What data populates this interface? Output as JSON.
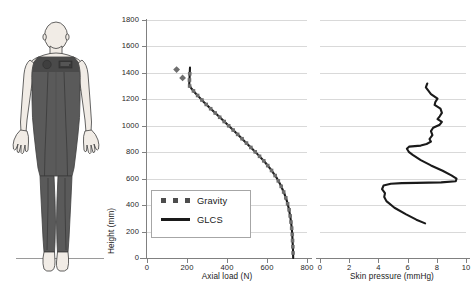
{
  "figure": {
    "name": "human-figure-wearing-glcs",
    "colors": {
      "skin": "#f1ece6",
      "suit": "#5a5a5a",
      "suit_dark": "#4a4a4a",
      "outline": "#3d3d3d",
      "ground": "#9a9a9a"
    }
  },
  "chart_data": [
    {
      "id": "axial-load",
      "type": "line",
      "title": "",
      "xlabel": "Axial load (N)",
      "ylabel": "Height (mm)",
      "xlim": [
        0,
        800
      ],
      "ylim": [
        0,
        1800
      ],
      "xticks": [
        0,
        200,
        400,
        600,
        800
      ],
      "yticks": [
        0,
        200,
        400,
        600,
        800,
        1000,
        1200,
        1400,
        1600,
        1800
      ],
      "grid": "horizontal",
      "legend_position": "bottom-left",
      "series": [
        {
          "name": "Gravity",
          "style": "dotted-marker",
          "color": "#6e6e6e",
          "points": [
            [
              148,
              1425
            ],
            [
              178,
              1362
            ]
          ]
        },
        {
          "name": "GLCS",
          "style": "solid-line",
          "color": "#1a1a1a",
          "points": [
            [
              215,
              1440
            ],
            [
              213,
              1370
            ],
            [
              211,
              1305
            ],
            [
              222,
              1282
            ],
            [
              240,
              1250
            ],
            [
              262,
              1215
            ],
            [
              285,
              1178
            ],
            [
              312,
              1138
            ],
            [
              340,
              1098
            ],
            [
              368,
              1058
            ],
            [
              398,
              1015
            ],
            [
              428,
              972
            ],
            [
              458,
              928
            ],
            [
              490,
              880
            ],
            [
              522,
              832
            ],
            [
              556,
              780
            ],
            [
              588,
              728
            ],
            [
              618,
              672
            ],
            [
              646,
              612
            ],
            [
              668,
              552
            ],
            [
              686,
              490
            ],
            [
              700,
              428
            ],
            [
              710,
              368
            ],
            [
              717,
              308
            ],
            [
              722,
              248
            ],
            [
              726,
              186
            ],
            [
              728,
              124
            ],
            [
              730,
              62
            ],
            [
              731,
              0
            ]
          ]
        }
      ]
    },
    {
      "id": "skin-pressure",
      "type": "line",
      "title": "",
      "xlabel": "Skin pressure (mmHg)",
      "ylabel": "",
      "xlim": [
        0,
        10
      ],
      "ylim": [
        0,
        1800
      ],
      "xticks": [
        0,
        2,
        4,
        6,
        8,
        10
      ],
      "yticks": [
        0,
        200,
        400,
        600,
        800,
        1000,
        1200,
        1400,
        1600,
        1800
      ],
      "grid": "horizontal",
      "series": [
        {
          "name": "Skin pressure",
          "style": "solid-line",
          "color": "#1a1a1a",
          "points": [
            [
              7.35,
              1320
            ],
            [
              7.25,
              1290
            ],
            [
              7.6,
              1240
            ],
            [
              8.05,
              1205
            ],
            [
              7.9,
              1180
            ],
            [
              7.85,
              1158
            ],
            [
              8.25,
              1130
            ],
            [
              8.35,
              1098
            ],
            [
              8.2,
              1072
            ],
            [
              8.05,
              1050
            ],
            [
              8.35,
              1030
            ],
            [
              8.2,
              1008
            ],
            [
              7.75,
              985
            ],
            [
              7.6,
              960
            ],
            [
              7.7,
              930
            ],
            [
              7.5,
              900
            ],
            [
              7.6,
              880
            ],
            [
              7.3,
              862
            ],
            [
              6.9,
              850
            ],
            [
              6.1,
              842
            ],
            [
              5.95,
              826
            ],
            [
              6.1,
              800
            ],
            [
              6.35,
              780
            ],
            [
              6.9,
              740
            ],
            [
              7.6,
              700
            ],
            [
              8.4,
              660
            ],
            [
              9.0,
              625
            ],
            [
              9.35,
              600
            ],
            [
              9.3,
              580
            ],
            [
              8.3,
              572
            ],
            [
              6.6,
              568
            ],
            [
              5.6,
              566
            ],
            [
              4.85,
              562
            ],
            [
              4.35,
              548
            ],
            [
              4.25,
              520
            ],
            [
              4.45,
              490
            ],
            [
              4.4,
              462
            ],
            [
              4.55,
              430
            ],
            [
              5.1,
              380
            ],
            [
              5.9,
              330
            ],
            [
              6.6,
              290
            ],
            [
              7.2,
              262
            ]
          ]
        }
      ]
    }
  ],
  "legend": {
    "entries": [
      {
        "label": "Gravity",
        "key": "dots"
      },
      {
        "label": "GLCS",
        "key": "line"
      }
    ]
  },
  "axis_labels": {
    "left_y_title": "Height (mm)",
    "left_x_title": "Axial load (N)",
    "right_x_title": "Skin pressure (mmHg)",
    "left_y_ticks": [
      "0",
      "200",
      "400",
      "600",
      "800",
      "1000",
      "1200",
      "1400",
      "1600",
      "1800"
    ],
    "left_x_ticks": [
      "0",
      "200",
      "400",
      "600",
      "800"
    ],
    "right_x_ticks": [
      "0",
      "2",
      "4",
      "6",
      "8",
      "10"
    ]
  }
}
